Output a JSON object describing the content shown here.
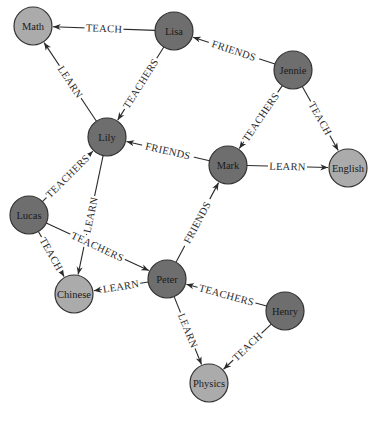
{
  "graph": {
    "title": "",
    "colors": {
      "person": "#6e6e6e",
      "subject": "#ababab",
      "edge": "#2a2a2a",
      "background": "#ffffff"
    },
    "nodes": [
      {
        "id": "math",
        "label": "Math",
        "type": "subject",
        "x": 33,
        "y": 26
      },
      {
        "id": "lisa",
        "label": "Lisa",
        "type": "person",
        "x": 174,
        "y": 31
      },
      {
        "id": "jennie",
        "label": "Jennie",
        "type": "person",
        "x": 293,
        "y": 70
      },
      {
        "id": "lily",
        "label": "Lily",
        "type": "person",
        "x": 107,
        "y": 137
      },
      {
        "id": "mark",
        "label": "Mark",
        "type": "person",
        "x": 228,
        "y": 165
      },
      {
        "id": "english",
        "label": "English",
        "type": "subject",
        "x": 348,
        "y": 168
      },
      {
        "id": "lucas",
        "label": "Lucas",
        "type": "person",
        "x": 29,
        "y": 215
      },
      {
        "id": "peter",
        "label": "Peter",
        "type": "person",
        "x": 167,
        "y": 279
      },
      {
        "id": "chinese",
        "label": "Chinese",
        "type": "subject",
        "x": 74,
        "y": 294
      },
      {
        "id": "henry",
        "label": "Henry",
        "type": "person",
        "x": 285,
        "y": 311
      },
      {
        "id": "physics",
        "label": "Physics",
        "type": "subject",
        "x": 209,
        "y": 383
      }
    ],
    "edges": [
      {
        "from": "lisa",
        "to": "math",
        "label": "TEACH"
      },
      {
        "from": "lily",
        "to": "math",
        "label": "LEARN"
      },
      {
        "from": "lisa",
        "to": "lily",
        "label": "TEACHERS"
      },
      {
        "from": "jennie",
        "to": "lisa",
        "label": "FRIENDS"
      },
      {
        "from": "jennie",
        "to": "mark",
        "label": "TEACHERS"
      },
      {
        "from": "jennie",
        "to": "english",
        "label": "TEACH"
      },
      {
        "from": "mark",
        "to": "lily",
        "label": "FRIENDS"
      },
      {
        "from": "mark",
        "to": "english",
        "label": "LEARN"
      },
      {
        "from": "lucas",
        "to": "lily",
        "label": "TEACHERS"
      },
      {
        "from": "lily",
        "to": "chinese",
        "label": "LEARN"
      },
      {
        "from": "lucas",
        "to": "chinese",
        "label": "TEACH"
      },
      {
        "from": "lucas",
        "to": "peter",
        "label": "TEACHERS"
      },
      {
        "from": "peter",
        "to": "mark",
        "label": "FRIENDS"
      },
      {
        "from": "peter",
        "to": "chinese",
        "label": "LEARN"
      },
      {
        "from": "henry",
        "to": "peter",
        "label": "TEACHERS"
      },
      {
        "from": "peter",
        "to": "physics",
        "label": "LEARN"
      },
      {
        "from": "henry",
        "to": "physics",
        "label": "TEACH"
      }
    ]
  }
}
